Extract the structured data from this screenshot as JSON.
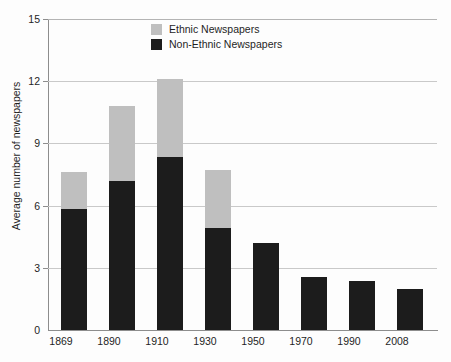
{
  "chart_data": {
    "type": "bar",
    "stacked": true,
    "title": "",
    "subtitle": "",
    "xlabel": "",
    "ylabel": "Average number of newspapers",
    "categories": [
      "1869",
      "1890",
      "1910",
      "1930",
      "1950",
      "1970",
      "1990",
      "2008"
    ],
    "series": [
      {
        "name": "Non-Ethnic Newspapers",
        "color": "#1c1c1c",
        "values": [
          5.85,
          7.2,
          8.35,
          4.9,
          4.2,
          2.55,
          2.35,
          2.0
        ]
      },
      {
        "name": "Ethnic Newspapers",
        "color": "#bfbfbf",
        "values": [
          1.75,
          3.6,
          3.75,
          2.8,
          0,
          0,
          0,
          0
        ]
      }
    ],
    "totals": [
      7.6,
      10.8,
      12.1,
      7.7,
      4.2,
      2.55,
      2.35,
      2.0
    ],
    "ylim": [
      0,
      15
    ],
    "yticks": [
      0,
      3,
      6,
      9,
      12,
      15
    ],
    "ytick_labels": [
      "0",
      "3",
      "6",
      "9",
      "12",
      "15"
    ],
    "grid": true,
    "legend_position": "top-center"
  },
  "legend": {
    "entries": [
      {
        "label": "Ethnic Newspapers",
        "color": "#bfbfbf"
      },
      {
        "label": "Non-Ethnic Newspapers",
        "color": "#1c1c1c"
      }
    ]
  }
}
